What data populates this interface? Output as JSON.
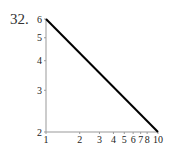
{
  "problem_label": "32.",
  "chart_data": {
    "type": "line",
    "title": "",
    "xlabel": "",
    "ylabel": "",
    "xscale": "log",
    "yscale": "log",
    "xlim": [
      1,
      10
    ],
    "ylim": [
      2,
      6
    ],
    "grid": false,
    "x_ticks": [
      1,
      2,
      3,
      4,
      5,
      6,
      7,
      8,
      10
    ],
    "x_tick_labels": [
      "1",
      "2",
      "3",
      "4",
      "5",
      "6",
      "7",
      "8",
      "10"
    ],
    "y_ticks": [
      2,
      3,
      4,
      5,
      6
    ],
    "y_tick_labels": [
      "2",
      "3",
      "4",
      "5",
      "6"
    ],
    "series": [
      {
        "name": "line",
        "x": [
          1,
          10
        ],
        "y": [
          6,
          2
        ],
        "color": "#000000"
      }
    ]
  },
  "colors": {
    "axis": "#999999",
    "line": "#000000"
  }
}
